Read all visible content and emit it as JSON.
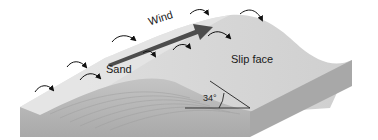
{
  "diagram": {
    "type": "sand dune cross-section",
    "labels": {
      "wind": "Wind",
      "sand": "Sand",
      "slip_face": "Slip face",
      "angle": "34°"
    },
    "angle_value_degrees": 34,
    "colors": {
      "top_surface": "#d9d9d9",
      "front_face": "#b3b3b3",
      "side_face": "#a6a6a6",
      "wind_arrow": "#4d4d4d",
      "arrows": "#111111",
      "lines": "#222222",
      "background": "#ffffff"
    },
    "arrow_count": 9
  }
}
